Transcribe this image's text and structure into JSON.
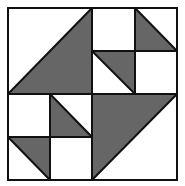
{
  "diagram": {
    "type": "quilt-block",
    "colors": {
      "fill_dark": "#666666",
      "fill_light": "#ffffff",
      "stroke": "#111111"
    },
    "grid": {
      "columns": 4,
      "rows": 4
    },
    "quadrants": [
      {
        "position": "top-left",
        "pattern": "half-square triangle, dark lower-right"
      },
      {
        "position": "top-right",
        "pattern": "four-patch with two dark triangles"
      },
      {
        "position": "bottom-left",
        "pattern": "four-patch with two dark triangles"
      },
      {
        "position": "bottom-right",
        "pattern": "half-square triangle, dark upper-left"
      }
    ]
  }
}
